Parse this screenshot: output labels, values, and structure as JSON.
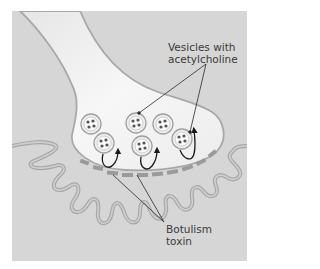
{
  "figure": {
    "colors": {
      "background": "#d6d6d6",
      "axon_fill": "#f2f2f2",
      "membrane": "#a8a8a8",
      "receptor": "#9a9a9a",
      "arrow": "#1a1a1a"
    }
  },
  "labels": {
    "vesicles_line1": "Vesicles with",
    "vesicles_line2": "acetylcholine",
    "toxin_line1": "Botulism",
    "toxin_line2": "toxin"
  }
}
